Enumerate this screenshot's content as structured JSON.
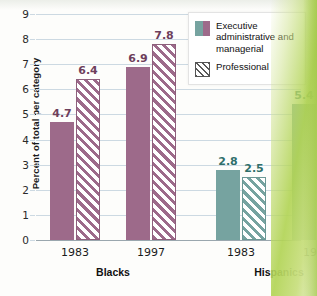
{
  "chart_data": {
    "type": "bar",
    "title": "",
    "xlabel": "",
    "ylabel": "Percent of total per category",
    "ylim": [
      0,
      9
    ],
    "yticks": [
      "0",
      "1",
      "2",
      "3",
      "4",
      "5",
      "6",
      "7",
      "8",
      "9"
    ],
    "grid": true,
    "legend_position": "top-right",
    "groups": [
      {
        "name": "Blacks",
        "color": "#9d6a8a",
        "label_color": "#6e3f5c",
        "years": [
          {
            "year": "1983",
            "bars": [
              {
                "series": "Executive administrative and managerial",
                "value": 4.7,
                "label": "4.7",
                "fill": "solid"
              },
              {
                "series": "Professional",
                "value": 6.4,
                "label": "6.4",
                "fill": "hatched"
              }
            ]
          },
          {
            "year": "1997",
            "bars": [
              {
                "series": "Executive administrative and managerial",
                "value": 6.9,
                "label": "6.9",
                "fill": "solid"
              },
              {
                "series": "Professional",
                "value": 7.8,
                "label": "7.8",
                "fill": "hatched"
              }
            ]
          }
        ]
      },
      {
        "name": "Hispanics",
        "color": "#76a3a0",
        "label_color": "#2f6f6b",
        "years": [
          {
            "year": "1983",
            "bars": [
              {
                "series": "Executive administrative and managerial",
                "value": 2.8,
                "label": "2.8",
                "fill": "solid"
              },
              {
                "series": "Professional",
                "value": 2.5,
                "label": "2.5",
                "fill": "hatched"
              }
            ]
          },
          {
            "year": "1997",
            "bars": [
              {
                "series": "Executive administrative and managerial",
                "value": 5.4,
                "label": "5.4",
                "fill": "solid"
              },
              {
                "series": "Professional",
                "value": 4.5,
                "label": "4.5",
                "fill": "hatched"
              }
            ]
          }
        ]
      }
    ],
    "series": [
      {
        "name": "Executive administrative and managerial",
        "categories": [
          "Blacks 1983",
          "Blacks 1997",
          "Hispanics 1983",
          "Hispanics 1997"
        ],
        "values": [
          4.7,
          6.9,
          2.8,
          5.4
        ]
      },
      {
        "name": "Professional",
        "categories": [
          "Blacks 1983",
          "Blacks 1997",
          "Hispanics 1983",
          "Hispanics 1997"
        ],
        "values": [
          6.4,
          7.8,
          2.5,
          4.5
        ]
      }
    ]
  },
  "legend": {
    "items": [
      {
        "label": "Executive administrative and managerial",
        "swatch": "two-tone"
      },
      {
        "label": "Professional",
        "swatch": "hatched"
      }
    ]
  },
  "colors": {
    "purple": "#9d6a8a",
    "purple_dark": "#6e3f5c",
    "teal": "#76a3a0",
    "teal_dark": "#2f6f6b",
    "gridline": "#ccd9e2",
    "page_edge_green": "#b2d456"
  }
}
